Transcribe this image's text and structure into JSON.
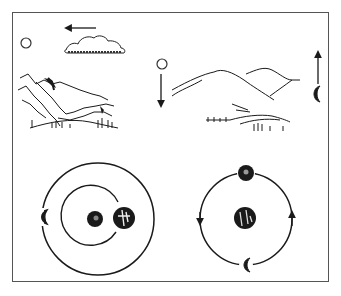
{
  "figure": {
    "type": "illustration",
    "colors": {
      "ink": "#1a1a1a",
      "frame": "#555555",
      "background": "#ffffff"
    },
    "panels": [
      {
        "id": "top-left",
        "elements": [
          "sun-icon",
          "cloud",
          "arrow-left",
          "mountains-rocky",
          "trees"
        ]
      },
      {
        "id": "top-right",
        "elements": [
          "sun-icon",
          "arrow-down",
          "mountains-rolling",
          "crescent-moon-icon",
          "arrow-up"
        ]
      },
      {
        "id": "bottom-left",
        "elements": [
          "large-orbit",
          "small-orbit",
          "sun-icon",
          "earth-icon",
          "crescent-moon-icon"
        ]
      },
      {
        "id": "bottom-right",
        "elements": [
          "orbit-circle",
          "earth-icon",
          "sun-icon",
          "crescent-moon-icon",
          "arrow-up",
          "arrow-down"
        ]
      }
    ]
  }
}
